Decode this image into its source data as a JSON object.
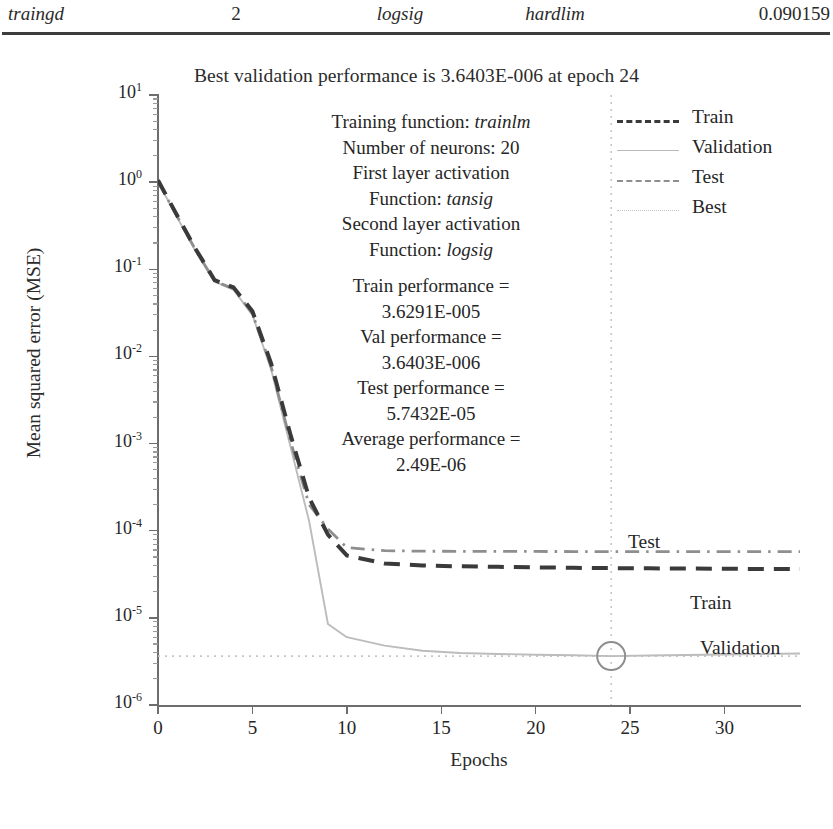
{
  "table_fragment": {
    "row": [
      "traingd",
      "2",
      "logsig",
      "hardlim",
      "0.090159"
    ]
  },
  "chart_data": {
    "type": "line",
    "title": "Best validation performance is 3.6403E-006 at epoch 24",
    "xlabel": "Epochs",
    "ylabel": "Mean squared error (MSE)",
    "xlim": [
      0,
      34
    ],
    "ylim_log10": [
      -6,
      1
    ],
    "xticks": [
      "0",
      "5",
      "10",
      "15",
      "20",
      "25",
      "30"
    ],
    "xtick_values": [
      0,
      5,
      10,
      15,
      20,
      25,
      30
    ],
    "ytick_labels": [
      "10",
      "10",
      "10",
      "10",
      "10",
      "10",
      "10",
      "10"
    ],
    "ytick_exponents": [
      "1",
      "0",
      "-1",
      "-2",
      "-3",
      "-4",
      "-5",
      "-6"
    ],
    "ytick_values": [
      10,
      1,
      0.1,
      0.01,
      0.001,
      0.0001,
      1e-05,
      1e-06
    ],
    "grid": false,
    "legend_position": "top-right",
    "best_epoch": 24,
    "best_value": 3.6403e-06,
    "series": [
      {
        "name": "Train",
        "style": "dashed",
        "color": "#3a3a3a",
        "x": [
          0,
          1,
          2,
          3,
          4,
          5,
          6,
          7,
          8,
          9,
          10,
          12,
          14,
          16,
          18,
          20,
          22,
          24,
          26,
          28,
          30,
          32,
          34
        ],
        "y": [
          1.05,
          0.42,
          0.17,
          0.075,
          0.062,
          0.033,
          0.0082,
          0.0013,
          0.00024,
          9e-05,
          5.2e-05,
          4.2e-05,
          4e-05,
          3.9e-05,
          3.85e-05,
          3.8e-05,
          3.75e-05,
          3.72e-05,
          3.7e-05,
          3.68e-05,
          3.66e-05,
          3.64e-05,
          3.63e-05
        ]
      },
      {
        "name": "Validation",
        "style": "solid",
        "color": "#bcbcbc",
        "x": [
          0,
          1,
          2,
          3,
          4,
          5,
          6,
          7,
          8,
          9,
          10,
          12,
          14,
          16,
          18,
          20,
          22,
          24,
          26,
          28,
          30,
          32,
          34
        ],
        "y": [
          1.0,
          0.4,
          0.16,
          0.072,
          0.058,
          0.03,
          0.007,
          0.00095,
          0.00013,
          8.5e-06,
          6e-06,
          4.8e-06,
          4.2e-06,
          3.95e-06,
          3.85e-06,
          3.78e-06,
          3.72e-06,
          3.6403e-06,
          3.7e-06,
          3.75e-06,
          3.8e-06,
          3.85e-06,
          3.9e-06
        ]
      },
      {
        "name": "Test",
        "style": "dashdot",
        "color": "#8e8e8e",
        "x": [
          0,
          1,
          2,
          3,
          4,
          5,
          6,
          7,
          8,
          9,
          10,
          12,
          14,
          16,
          18,
          20,
          22,
          24,
          26,
          28,
          30,
          32,
          34
        ],
        "y": [
          1.02,
          0.41,
          0.165,
          0.073,
          0.06,
          0.031,
          0.0075,
          0.0011,
          0.0002,
          0.000105,
          6.4e-05,
          5.9e-05,
          5.82e-05,
          5.8e-05,
          5.79e-05,
          5.78e-05,
          5.77e-05,
          5.76e-05,
          5.76e-05,
          5.76e-05,
          5.76e-05,
          5.76e-05,
          5.76e-05
        ]
      },
      {
        "name": "Best",
        "style": "dotted",
        "color": "#c6c6c6"
      }
    ],
    "curve_labels": [
      "Test",
      "Train",
      "Validation"
    ],
    "annotation_lines": [
      "Training function: trainlm",
      "Number of neurons: 20",
      "First layer activation",
      "Function: tansig",
      "Second layer activation",
      "Function: logsig",
      "Train performance =",
      "3.6291E-005",
      "Val performance =",
      "3.6403E-006",
      "Test performance =",
      "5.7432E-05",
      "Average performance =",
      "2.49E-06"
    ],
    "annotation": {
      "training_function_label": "Training function: ",
      "training_function_value": "trainlm",
      "neurons_label": "Number of neurons: 20",
      "first_layer_label": "First layer activation",
      "first_layer_fn_label": "Function: ",
      "first_layer_fn_value": "tansig",
      "second_layer_label": "Second layer activation",
      "second_layer_fn_label": "Function: ",
      "second_layer_fn_value": "logsig",
      "train_perf_label": "Train performance =",
      "train_perf_value": "3.6291E-005",
      "val_perf_label": "Val performance =",
      "val_perf_value": "3.6403E-006",
      "test_perf_label": "Test performance =",
      "test_perf_value": "5.7432E-05",
      "avg_perf_label": "Average performance =",
      "avg_perf_value": "2.49E-06"
    },
    "legend": [
      {
        "label": "Train"
      },
      {
        "label": "Validation"
      },
      {
        "label": "Test"
      },
      {
        "label": "Best"
      }
    ]
  },
  "colors": {
    "train": "#3a3a3a",
    "validation": "#bcbcbc",
    "test": "#8e8e8e",
    "best": "#c6c6c6",
    "axis": "#6d6d6d",
    "text": "#262626"
  }
}
